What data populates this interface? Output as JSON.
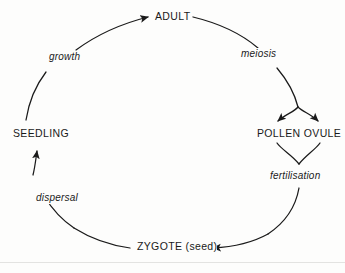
{
  "diagram": {
    "type": "cycle-diagram",
    "background_color": "#fdfdfc",
    "stroke_color": "#1a1a1a",
    "stages": [
      {
        "id": "adult",
        "label": "ADULT",
        "position": "top"
      },
      {
        "id": "pollen",
        "label": "POLLEN OVULE",
        "position": "right"
      },
      {
        "id": "zygote",
        "label": "ZYGOTE (seed)",
        "position": "bottom"
      },
      {
        "id": "seedling",
        "label": "SEEDLING",
        "position": "left"
      }
    ],
    "processes": [
      {
        "id": "meiosis",
        "label": "meiosis",
        "from": "adult",
        "to": "pollen",
        "position": "upper-right"
      },
      {
        "id": "fertilisation",
        "label": "fertilisation",
        "from": "pollen",
        "to": "zygote",
        "position": "lower-right"
      },
      {
        "id": "dispersal",
        "label": "dispersal",
        "from": "zygote",
        "to": "seedling",
        "position": "lower-left"
      },
      {
        "id": "growth",
        "label": "growth",
        "from": "seedling",
        "to": "adult",
        "position": "upper-left"
      }
    ]
  }
}
